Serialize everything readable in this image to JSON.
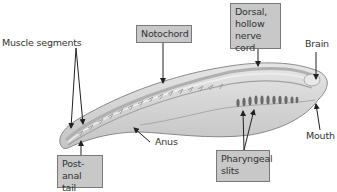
{
  "diagram": {
    "colors": {
      "label_box_fill": "#c8c8c8",
      "label_box_border": "#7a7a7a",
      "body_fill": "#d9d9d9",
      "body_outline": "#8a8a8a",
      "slit_color": "#6a6a6a",
      "arrow_color": "#222222"
    },
    "boxed_labels": {
      "notochord": {
        "lines": [
          "Notochord"
        ]
      },
      "nerve_cord": {
        "lines": [
          "Dorsal,",
          "hollow",
          "nerve cord"
        ]
      },
      "post_anal_tail": {
        "lines": [
          "Post-anal",
          "tail"
        ]
      },
      "pharyngeal_slits": {
        "lines": [
          "Pharyngeal",
          "slits"
        ]
      }
    },
    "plain_labels": {
      "muscle_segments": "Muscle segments",
      "brain": "Brain",
      "anus": "Anus",
      "mouth": "Mouth"
    },
    "pharyngeal_slit_count": 11
  }
}
